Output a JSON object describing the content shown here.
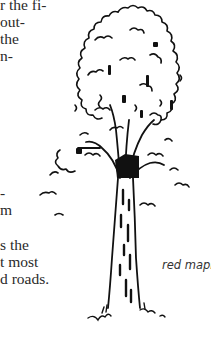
{
  "document": {
    "text_fragments_top": [
      {
        "text": "r the fi-",
        "top": -4
      },
      {
        "text": "out-",
        "top": 13
      },
      {
        "text": "the",
        "top": 30
      },
      {
        "text": "n-",
        "top": 47
      }
    ],
    "text_fragments_bottom": [
      {
        "text": "-",
        "top": 184
      },
      {
        "text": "m",
        "top": 201
      },
      {
        "text": "s the",
        "top": 236
      },
      {
        "text": "t most",
        "top": 253
      },
      {
        "text": "d roads.",
        "top": 270
      }
    ]
  },
  "figure": {
    "illustration": "red-maple-tree-drawing",
    "caption": "red maple"
  }
}
